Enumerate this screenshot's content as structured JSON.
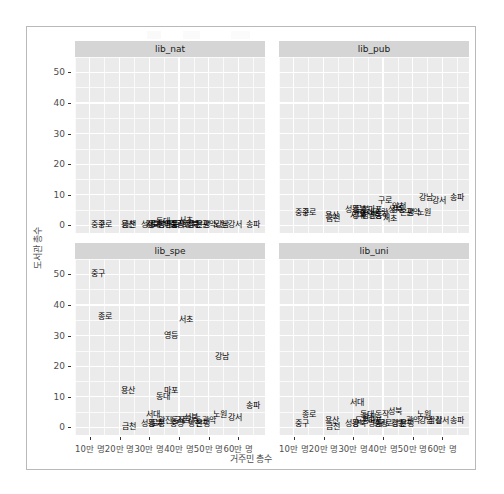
{
  "chart_data": {
    "type": "scatter",
    "title": "",
    "xlabel": "거주민 총수",
    "ylabel": "도서관 총수",
    "xlim": [
      50000,
      690000
    ],
    "ylim": [
      -2.5,
      55
    ],
    "grid": true,
    "legend": "none",
    "facet_layout": "2x2",
    "xticks": [
      {
        "value": 100000,
        "label": "10만 명"
      },
      {
        "value": 200000,
        "label": "20만 명"
      },
      {
        "value": 300000,
        "label": "30만 명"
      },
      {
        "value": 400000,
        "label": "40만 명"
      },
      {
        "value": 500000,
        "label": "50만 명"
      },
      {
        "value": 600000,
        "label": "60만 명"
      }
    ],
    "yticks": [
      {
        "value": 0,
        "label": "0"
      },
      {
        "value": 10,
        "label": "10"
      },
      {
        "value": 20,
        "label": "20"
      },
      {
        "value": 30,
        "label": "30"
      },
      {
        "value": 40,
        "label": "40"
      },
      {
        "value": 50,
        "label": "50"
      }
    ],
    "facets": [
      {
        "name": "lib_nat",
        "row": 0,
        "col": 0,
        "points": [
          {
            "label": "중구",
            "x": 126000,
            "y": 0
          },
          {
            "label": "종로",
            "x": 150000,
            "y": 0
          },
          {
            "label": "금천",
            "x": 232000,
            "y": 0
          },
          {
            "label": "성동",
            "x": 295000,
            "y": 0
          },
          {
            "label": "용산",
            "x": 228000,
            "y": 0
          },
          {
            "label": "강북",
            "x": 312000,
            "y": 0
          },
          {
            "label": "도봉",
            "x": 330000,
            "y": 0
          },
          {
            "label": "서대",
            "x": 312000,
            "y": 0
          },
          {
            "label": "동대",
            "x": 345000,
            "y": 1.1
          },
          {
            "label": "마포",
            "x": 375000,
            "y": 0
          },
          {
            "label": "광진",
            "x": 352000,
            "y": 0
          },
          {
            "label": "중랑",
            "x": 395000,
            "y": 0
          },
          {
            "label": "영등",
            "x": 372000,
            "y": 0
          },
          {
            "label": "서초",
            "x": 425000,
            "y": 1.4
          },
          {
            "label": "성북",
            "x": 440000,
            "y": 0
          },
          {
            "label": "동작",
            "x": 398000,
            "y": 0
          },
          {
            "label": "양천",
            "x": 455000,
            "y": 0
          },
          {
            "label": "구로",
            "x": 410000,
            "y": 0
          },
          {
            "label": "강동",
            "x": 452000,
            "y": 0
          },
          {
            "label": "관악",
            "x": 500000,
            "y": 0
          },
          {
            "label": "은평",
            "x": 480000,
            "y": 0
          },
          {
            "label": "강서",
            "x": 588000,
            "y": 0
          },
          {
            "label": "노원",
            "x": 540000,
            "y": 0
          },
          {
            "label": "강남",
            "x": 545000,
            "y": 0
          },
          {
            "label": "송파",
            "x": 650000,
            "y": 0
          }
        ]
      },
      {
        "name": "lib_pub",
        "row": 0,
        "col": 1,
        "points": [
          {
            "label": "중구",
            "x": 126000,
            "y": 4
          },
          {
            "label": "종로",
            "x": 152000,
            "y": 4
          },
          {
            "label": "금천",
            "x": 232000,
            "y": 2
          },
          {
            "label": "용산",
            "x": 228000,
            "y": 3
          },
          {
            "label": "성동",
            "x": 295000,
            "y": 5
          },
          {
            "label": "서대",
            "x": 312000,
            "y": 3
          },
          {
            "label": "강북",
            "x": 318000,
            "y": 5
          },
          {
            "label": "도봉",
            "x": 330000,
            "y": 5
          },
          {
            "label": "동대",
            "x": 345000,
            "y": 4
          },
          {
            "label": "마포",
            "x": 375000,
            "y": 5
          },
          {
            "label": "광진",
            "x": 352000,
            "y": 3
          },
          {
            "label": "중랑",
            "x": 395000,
            "y": 4
          },
          {
            "label": "영등",
            "x": 372000,
            "y": 3
          },
          {
            "label": "구로",
            "x": 408000,
            "y": 8
          },
          {
            "label": "강북",
            "x": 318000,
            "y": 3
          },
          {
            "label": "서초",
            "x": 425000,
            "y": 2
          },
          {
            "label": "성북",
            "x": 440000,
            "y": 5
          },
          {
            "label": "동작",
            "x": 398000,
            "y": 3
          },
          {
            "label": "양천",
            "x": 455000,
            "y": 6
          },
          {
            "label": "강동",
            "x": 452000,
            "y": 5
          },
          {
            "label": "관악",
            "x": 500000,
            "y": 4
          },
          {
            "label": "은평",
            "x": 480000,
            "y": 4
          },
          {
            "label": "노원",
            "x": 540000,
            "y": 4
          },
          {
            "label": "강남",
            "x": 545000,
            "y": 9
          },
          {
            "label": "강서",
            "x": 588000,
            "y": 8
          },
          {
            "label": "송파",
            "x": 650000,
            "y": 9
          }
        ]
      },
      {
        "name": "lib_spe",
        "row": 1,
        "col": 0,
        "points": [
          {
            "label": "중구",
            "x": 126000,
            "y": 50
          },
          {
            "label": "종로",
            "x": 152000,
            "y": 36
          },
          {
            "label": "서초",
            "x": 425000,
            "y": 35
          },
          {
            "label": "영등",
            "x": 372000,
            "y": 30
          },
          {
            "label": "강남",
            "x": 545000,
            "y": 23
          },
          {
            "label": "용산",
            "x": 228000,
            "y": 12
          },
          {
            "label": "마포",
            "x": 375000,
            "y": 12
          },
          {
            "label": "동대",
            "x": 345000,
            "y": 10
          },
          {
            "label": "송파",
            "x": 650000,
            "y": 7
          },
          {
            "label": "서대",
            "x": 312000,
            "y": 4
          },
          {
            "label": "노원",
            "x": 540000,
            "y": 4
          },
          {
            "label": "성북",
            "x": 440000,
            "y": 3
          },
          {
            "label": "금천",
            "x": 232000,
            "y": 0
          },
          {
            "label": "성동",
            "x": 295000,
            "y": 1
          },
          {
            "label": "강북",
            "x": 318000,
            "y": 1
          },
          {
            "label": "도봉",
            "x": 330000,
            "y": 1
          },
          {
            "label": "광진",
            "x": 352000,
            "y": 2
          },
          {
            "label": "중랑",
            "x": 395000,
            "y": 1
          },
          {
            "label": "동작",
            "x": 398000,
            "y": 2
          },
          {
            "label": "양천",
            "x": 455000,
            "y": 1
          },
          {
            "label": "구로",
            "x": 408000,
            "y": 2
          },
          {
            "label": "강동",
            "x": 452000,
            "y": 2
          },
          {
            "label": "관악",
            "x": 500000,
            "y": 2
          },
          {
            "label": "은평",
            "x": 480000,
            "y": 1
          },
          {
            "label": "강서",
            "x": 588000,
            "y": 3
          }
        ]
      },
      {
        "name": "lib_uni",
        "row": 1,
        "col": 1,
        "points": [
          {
            "label": "중구",
            "x": 126000,
            "y": 1
          },
          {
            "label": "종로",
            "x": 152000,
            "y": 4
          },
          {
            "label": "용산",
            "x": 228000,
            "y": 2
          },
          {
            "label": "금천",
            "x": 232000,
            "y": 0
          },
          {
            "label": "성동",
            "x": 295000,
            "y": 1
          },
          {
            "label": "서대",
            "x": 312000,
            "y": 8
          },
          {
            "label": "강북",
            "x": 318000,
            "y": 1
          },
          {
            "label": "도봉",
            "x": 330000,
            "y": 2
          },
          {
            "label": "동대",
            "x": 345000,
            "y": 4
          },
          {
            "label": "동작",
            "x": 398000,
            "y": 4
          },
          {
            "label": "광진",
            "x": 352000,
            "y": 3
          },
          {
            "label": "마포",
            "x": 375000,
            "y": 2
          },
          {
            "label": "노원",
            "x": 540000,
            "y": 4
          },
          {
            "label": "영등",
            "x": 372000,
            "y": 1
          },
          {
            "label": "중랑",
            "x": 395000,
            "y": 1
          },
          {
            "label": "성북",
            "x": 440000,
            "y": 5
          },
          {
            "label": "구로",
            "x": 408000,
            "y": 1
          },
          {
            "label": "양천",
            "x": 455000,
            "y": 1
          },
          {
            "label": "강동",
            "x": 452000,
            "y": 1
          },
          {
            "label": "은평",
            "x": 480000,
            "y": 1
          },
          {
            "label": "관악",
            "x": 500000,
            "y": 2
          },
          {
            "label": "강남",
            "x": 545000,
            "y": 2
          },
          {
            "label": "잠실",
            "x": 575000,
            "y": 2
          },
          {
            "label": "강서",
            "x": 600000,
            "y": 2
          },
          {
            "label": "송파",
            "x": 650000,
            "y": 2
          }
        ]
      }
    ]
  }
}
